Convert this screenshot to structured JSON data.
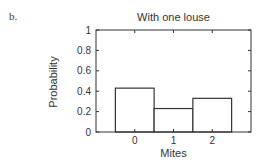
{
  "panel_label": "b.",
  "chart_data": {
    "type": "bar",
    "title": "With one louse",
    "xlabel": "Mites",
    "ylabel": "Probability",
    "categories": [
      "0",
      "1",
      "2"
    ],
    "values": [
      0.43,
      0.23,
      0.33
    ],
    "ylim": [
      0,
      1
    ],
    "xlim": [
      -1,
      3
    ],
    "yticks": [
      "0",
      "0.2",
      "0.4",
      "0.6",
      "0.8",
      "1"
    ],
    "xticks": [
      "0",
      "1",
      "2"
    ],
    "grid": false,
    "legend": null,
    "bar_fill": "#ffffff",
    "bar_edge": "#333333"
  }
}
